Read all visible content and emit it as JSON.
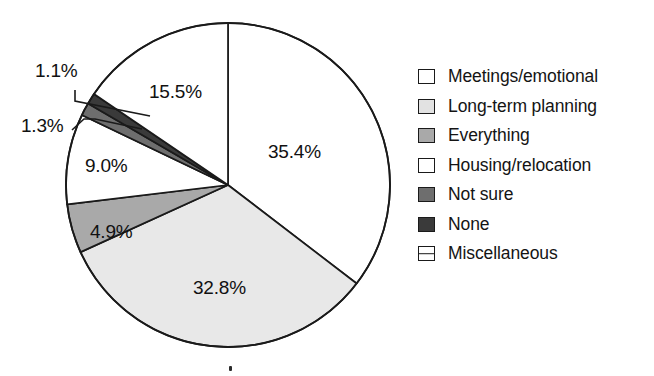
{
  "chart_data": {
    "type": "pie",
    "title": "",
    "subtitle": "",
    "xlabel": "",
    "ylabel": "",
    "legend_position": "right",
    "grid": false,
    "start_angle_deg": 0,
    "direction": "clockwise",
    "center": {
      "x": 228,
      "y": 185
    },
    "radius": 162,
    "categories": [
      "Meetings/emotional",
      "Long-term planning",
      "Everything",
      "Housing/relocation",
      "Not sure",
      "None",
      "Miscellaneous"
    ],
    "values": [
      35.4,
      32.8,
      4.9,
      9.0,
      1.3,
      1.1,
      15.5
    ],
    "value_labels": [
      "35.4%",
      "32.8%",
      "4.9%",
      "9.0%",
      "1.3%",
      "1.1%",
      "15.5%"
    ],
    "slice_colors": [
      "#ffffff",
      "#e8e8e8",
      "#a9a9a9",
      "#ffffff",
      "#6e6e6e",
      "#3a3a3a",
      "#ffffff"
    ],
    "slice_fill_patterns": [
      "solid",
      "solid",
      "solid",
      "solid",
      "solid",
      "solid",
      "solid"
    ],
    "stroke_color": "#1a1a1a",
    "slices": [
      {
        "label": "Meetings/emotional",
        "value": 35.4,
        "value_label": "35.4%",
        "color": "#ffffff",
        "label_x": 305,
        "label_y": 152,
        "callout": false
      },
      {
        "label": "Long-term planning",
        "value": 32.8,
        "value_label": "32.8%",
        "color": "#e8e8e8",
        "label_x": 230,
        "label_y": 288,
        "callout": false
      },
      {
        "label": "Everything",
        "value": 4.9,
        "value_label": "4.9%",
        "color": "#a9a9a9",
        "label_x": 118,
        "label_y": 232,
        "callout": false
      },
      {
        "label": "Housing/relocation",
        "value": 9.0,
        "value_label": "9.0%",
        "color": "#ffffff",
        "label_x": 113,
        "label_y": 166,
        "callout": false
      },
      {
        "label": "Not sure",
        "value": 1.3,
        "value_label": "1.3%",
        "color": "#6e6e6e",
        "label_x": 48,
        "label_y": 126,
        "callout": true
      },
      {
        "label": "None",
        "value": 1.1,
        "value_label": "1.1%",
        "color": "#3a3a3a",
        "label_x": 62,
        "label_y": 71,
        "callout": true
      },
      {
        "label": "Miscellaneous",
        "value": 15.5,
        "value_label": "15.5%",
        "color": "#ffffff",
        "label_x": 186,
        "label_y": 92,
        "callout": false
      }
    ]
  },
  "legend": {
    "items": [
      {
        "label": "Meetings/emotional",
        "swatch": "#ffffff",
        "pattern": "solid"
      },
      {
        "label": "Long-term planning",
        "swatch": "#e2e2e2",
        "pattern": "solid"
      },
      {
        "label": "Everything",
        "swatch": "#a9a9a9",
        "pattern": "solid"
      },
      {
        "label": "Housing/relocation",
        "swatch": "#ffffff",
        "pattern": "solid"
      },
      {
        "label": "Not sure",
        "swatch": "#6e6e6e",
        "pattern": "solid"
      },
      {
        "label": "None",
        "swatch": "#3a3a3a",
        "pattern": "solid"
      },
      {
        "label": "Miscellaneous",
        "swatch": "#ffffff",
        "pattern": "hline"
      }
    ]
  },
  "labels": {
    "pct_354": "35.4%",
    "pct_328": "32.8%",
    "pct_49": "4.9%",
    "pct_90": "9.0%",
    "pct_13": "1.3%",
    "pct_11": "1.1%",
    "pct_155": "15.5%"
  }
}
